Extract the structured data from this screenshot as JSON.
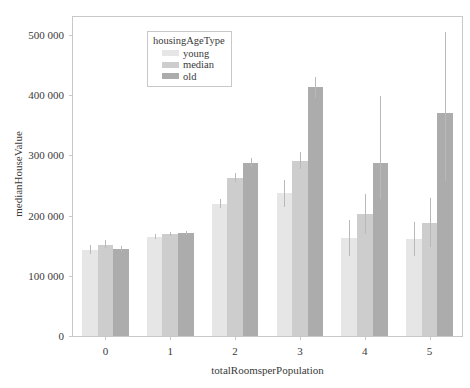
{
  "chart_data": {
    "type": "bar",
    "title": "",
    "xlabel": "totalRoomsperPopulation",
    "ylabel": "medianHouseValue",
    "categories": [
      "0",
      "1",
      "2",
      "3",
      "4",
      "5"
    ],
    "ylim": [
      0,
      530000
    ],
    "yticks": [
      0,
      100000,
      200000,
      300000,
      400000,
      500000
    ],
    "ytick_labels": [
      "0",
      "100 000",
      "200 000",
      "300 000",
      "400 000",
      "500 000"
    ],
    "grid": false,
    "legend_title": "housingAgeType",
    "legend_position": "top-left-inside",
    "error_bars": "confidence-interval",
    "series": [
      {
        "name": "young",
        "color": "#e6e6e6",
        "values": [
          143000,
          165000,
          220000,
          237000,
          163000,
          161000
        ],
        "err_low": [
          136000,
          161000,
          213000,
          215000,
          133000,
          133000
        ],
        "err_high": [
          152000,
          170000,
          228000,
          259000,
          193000,
          190000
        ]
      },
      {
        "name": "median",
        "color": "#cdcdcd",
        "values": [
          152000,
          169000,
          263000,
          291000,
          202000,
          188000
        ],
        "err_low": [
          146000,
          166000,
          256000,
          277000,
          170000,
          148000
        ],
        "err_high": [
          159000,
          173000,
          271000,
          306000,
          236000,
          230000
        ]
      },
      {
        "name": "old",
        "color": "#acacac",
        "values": [
          144000,
          171000,
          288000,
          413000,
          287000,
          370000
        ],
        "err_low": [
          139000,
          168000,
          280000,
          395000,
          228000,
          258000
        ],
        "err_high": [
          150000,
          175000,
          296000,
          431000,
          398000,
          505000
        ]
      }
    ]
  }
}
